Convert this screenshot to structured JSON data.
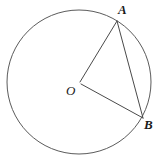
{
  "figure": {
    "kind": "geometry-diagram",
    "background_color": "#ffffff",
    "stroke_color": "#4a4a4a",
    "label_color": "#1a1a1a",
    "canvas": {
      "width": 158,
      "height": 161
    },
    "circle": {
      "name": "circle-O",
      "center": {
        "x": 79,
        "y": 82
      },
      "radius": 72,
      "stroke_color": "#5b5b5b",
      "stroke_width": 1,
      "fill": "none"
    },
    "points": [
      {
        "id": "A",
        "label": "A",
        "x": 117,
        "y": 21,
        "on": "circle"
      },
      {
        "id": "O",
        "label": "O",
        "x": 79,
        "y": 82,
        "on": "center"
      },
      {
        "id": "B",
        "label": "B",
        "x": 143,
        "y": 118,
        "on": "circle"
      }
    ],
    "segments": [
      {
        "id": "OA",
        "label": "OA",
        "from": "O",
        "to": "A",
        "kind": "radius",
        "x1": 80,
        "y1": 82,
        "x2": 117,
        "y2": 21
      },
      {
        "id": "OB",
        "label": "OB",
        "from": "O",
        "to": "B",
        "kind": "radius",
        "x1": 81,
        "y1": 84,
        "x2": 143,
        "y2": 118
      },
      {
        "id": "AB",
        "label": "AB",
        "from": "A",
        "to": "B",
        "kind": "chord",
        "x1": 117,
        "y1": 21,
        "x2": 143,
        "y2": 118
      }
    ],
    "labels": {
      "A": "A",
      "O": "O",
      "B": "B"
    }
  }
}
